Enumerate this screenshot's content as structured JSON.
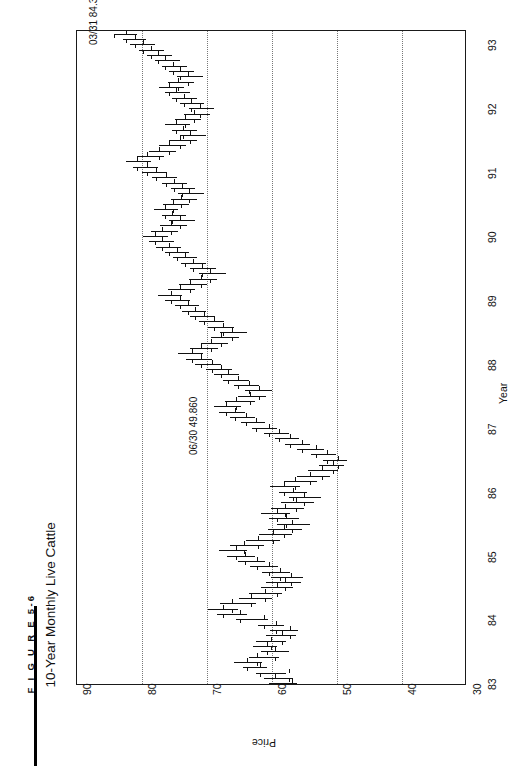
{
  "figure": {
    "number": "F I G U R E   5-6",
    "title": "10-Year Monthly Live Cattle"
  },
  "chart_data": {
    "type": "ohlc",
    "title": "10-Year Monthly Live Cattle",
    "xlabel": "Year",
    "ylabel": "Price",
    "orientation": "rotated-90-ccw",
    "xlim": [
      1983.0,
      1993.5
    ],
    "ylim": [
      30,
      90
    ],
    "xticks": [
      "83",
      "84",
      "85",
      "86",
      "87",
      "88",
      "89",
      "90",
      "91",
      "92",
      "93"
    ],
    "yticks": [
      "90",
      "80",
      "70",
      "60",
      "50",
      "40",
      "30"
    ],
    "ygrid_values": [
      80,
      70,
      60,
      50,
      40
    ],
    "grid": true,
    "legend": "none",
    "annotations": [
      {
        "label": "03/31 84.300",
        "date": "03/31",
        "value": 84.3
      },
      {
        "label": "06/30 49.860",
        "date": "06/30",
        "value": 49.86
      }
    ],
    "series_name": "Live Cattle monthly OHLC",
    "bars": [
      {
        "t": "1983-01",
        "high": 60.5,
        "low": 56.1,
        "open": 57.0,
        "close": 59.6
      },
      {
        "t": "1983-02",
        "high": 61.2,
        "low": 56.8,
        "open": 59.6,
        "close": 57.4
      },
      {
        "t": "1983-03",
        "high": 62.4,
        "low": 57.9,
        "open": 57.4,
        "close": 61.9
      },
      {
        "t": "1983-04",
        "high": 64.5,
        "low": 60.7,
        "open": 61.9,
        "close": 63.8
      },
      {
        "t": "1983-05",
        "high": 65.8,
        "low": 61.6,
        "open": 63.8,
        "close": 62.3
      },
      {
        "t": "1983-06",
        "high": 63.6,
        "low": 58.9,
        "open": 62.3,
        "close": 59.5
      },
      {
        "t": "1983-07",
        "high": 61.7,
        "low": 57.4,
        "open": 59.5,
        "close": 60.8
      },
      {
        "t": "1983-08",
        "high": 63.0,
        "low": 59.2,
        "open": 60.8,
        "close": 60.1
      },
      {
        "t": "1983-09",
        "high": 62.4,
        "low": 57.8,
        "open": 60.1,
        "close": 58.5
      },
      {
        "t": "1983-10",
        "high": 60.9,
        "low": 56.3,
        "open": 58.5,
        "close": 57.2
      },
      {
        "t": "1983-11",
        "high": 60.3,
        "low": 56.0,
        "open": 57.2,
        "close": 59.4
      },
      {
        "t": "1983-12",
        "high": 62.1,
        "low": 58.2,
        "open": 59.4,
        "close": 61.2
      },
      {
        "t": "1984-01",
        "high": 65.6,
        "low": 60.6,
        "open": 61.2,
        "close": 64.9
      },
      {
        "t": "1984-02",
        "high": 68.4,
        "low": 63.8,
        "open": 64.9,
        "close": 67.5
      },
      {
        "t": "1984-03",
        "high": 69.9,
        "low": 65.3,
        "open": 67.5,
        "close": 66.1
      },
      {
        "t": "1984-04",
        "high": 68.0,
        "low": 62.4,
        "open": 66.1,
        "close": 63.2
      },
      {
        "t": "1984-05",
        "high": 65.1,
        "low": 60.0,
        "open": 63.2,
        "close": 61.1
      },
      {
        "t": "1984-06",
        "high": 63.5,
        "low": 58.4,
        "open": 61.1,
        "close": 59.3
      },
      {
        "t": "1984-07",
        "high": 61.7,
        "low": 56.8,
        "open": 59.3,
        "close": 58.0
      },
      {
        "t": "1984-08",
        "high": 60.9,
        "low": 55.6,
        "open": 58.0,
        "close": 57.1
      },
      {
        "t": "1984-09",
        "high": 60.2,
        "low": 55.3,
        "open": 57.1,
        "close": 58.7
      },
      {
        "t": "1984-10",
        "high": 61.6,
        "low": 57.3,
        "open": 58.7,
        "close": 60.4
      },
      {
        "t": "1984-11",
        "high": 63.4,
        "low": 59.1,
        "open": 60.4,
        "close": 62.3
      },
      {
        "t": "1984-12",
        "high": 65.2,
        "low": 61.0,
        "open": 62.3,
        "close": 64.1
      },
      {
        "t": "1985-01",
        "high": 67.0,
        "low": 62.6,
        "open": 64.1,
        "close": 65.6
      },
      {
        "t": "1985-02",
        "high": 68.2,
        "low": 63.9,
        "open": 65.6,
        "close": 64.3
      },
      {
        "t": "1985-03",
        "high": 66.4,
        "low": 61.2,
        "open": 64.3,
        "close": 62.1
      },
      {
        "t": "1985-04",
        "high": 64.0,
        "low": 58.8,
        "open": 62.1,
        "close": 59.8
      },
      {
        "t": "1985-05",
        "high": 62.0,
        "low": 57.0,
        "open": 59.8,
        "close": 58.2
      },
      {
        "t": "1985-06",
        "high": 60.6,
        "low": 55.4,
        "open": 58.2,
        "close": 56.9
      },
      {
        "t": "1985-07",
        "high": 59.3,
        "low": 54.1,
        "open": 56.9,
        "close": 57.9
      },
      {
        "t": "1985-08",
        "high": 60.5,
        "low": 55.9,
        "open": 57.9,
        "close": 59.2
      },
      {
        "t": "1985-09",
        "high": 61.7,
        "low": 57.2,
        "open": 59.2,
        "close": 58.0
      },
      {
        "t": "1985-10",
        "high": 60.1,
        "low": 55.0,
        "open": 58.0,
        "close": 56.3
      },
      {
        "t": "1985-11",
        "high": 58.6,
        "low": 53.5,
        "open": 56.3,
        "close": 55.1
      },
      {
        "t": "1985-12",
        "high": 57.4,
        "low": 52.4,
        "open": 55.1,
        "close": 56.7
      },
      {
        "t": "1986-01",
        "high": 59.0,
        "low": 54.6,
        "open": 56.7,
        "close": 58.1
      },
      {
        "t": "1986-02",
        "high": 60.3,
        "low": 55.7,
        "open": 58.1,
        "close": 56.4
      },
      {
        "t": "1986-03",
        "high": 58.2,
        "low": 53.0,
        "open": 56.4,
        "close": 54.2
      },
      {
        "t": "1986-04",
        "high": 56.1,
        "low": 51.0,
        "open": 54.2,
        "close": 52.3
      },
      {
        "t": "1986-05",
        "high": 54.5,
        "low": 49.9,
        "open": 52.3,
        "close": 50.6
      },
      {
        "t": "1986-06",
        "high": 52.8,
        "low": 48.9,
        "open": 50.6,
        "close": 49.86
      },
      {
        "t": "1986-07",
        "high": 52.2,
        "low": 48.5,
        "open": 49.86,
        "close": 51.5
      },
      {
        "t": "1986-08",
        "high": 54.0,
        "low": 50.2,
        "open": 51.5,
        "close": 53.3
      },
      {
        "t": "1986-09",
        "high": 56.1,
        "low": 52.0,
        "open": 53.3,
        "close": 55.4
      },
      {
        "t": "1986-10",
        "high": 58.0,
        "low": 54.2,
        "open": 55.4,
        "close": 57.2
      },
      {
        "t": "1986-11",
        "high": 59.6,
        "low": 55.8,
        "open": 57.2,
        "close": 58.9
      },
      {
        "t": "1986-12",
        "high": 61.3,
        "low": 57.4,
        "open": 58.9,
        "close": 60.5
      },
      {
        "t": "1987-01",
        "high": 63.1,
        "low": 59.2,
        "open": 60.5,
        "close": 62.4
      },
      {
        "t": "1987-02",
        "high": 64.8,
        "low": 61.0,
        "open": 62.4,
        "close": 64.0
      },
      {
        "t": "1987-03",
        "high": 66.5,
        "low": 62.6,
        "open": 64.0,
        "close": 65.7
      },
      {
        "t": "1987-04",
        "high": 68.2,
        "low": 64.1,
        "open": 65.7,
        "close": 67.1
      },
      {
        "t": "1987-05",
        "high": 69.0,
        "low": 64.8,
        "open": 67.1,
        "close": 65.5
      },
      {
        "t": "1987-06",
        "high": 67.3,
        "low": 62.6,
        "open": 65.5,
        "close": 63.4
      },
      {
        "t": "1987-07",
        "high": 65.2,
        "low": 60.9,
        "open": 63.4,
        "close": 62.0
      },
      {
        "t": "1987-08",
        "high": 64.1,
        "low": 60.0,
        "open": 62.0,
        "close": 63.6
      },
      {
        "t": "1987-09",
        "high": 65.9,
        "low": 62.0,
        "open": 63.6,
        "close": 65.2
      },
      {
        "t": "1987-10",
        "high": 67.6,
        "low": 63.5,
        "open": 65.2,
        "close": 66.8
      },
      {
        "t": "1987-11",
        "high": 68.9,
        "low": 65.0,
        "open": 66.8,
        "close": 67.9
      },
      {
        "t": "1987-12",
        "high": 70.1,
        "low": 66.2,
        "open": 67.9,
        "close": 69.2
      },
      {
        "t": "1988-01",
        "high": 71.8,
        "low": 67.8,
        "open": 69.2,
        "close": 70.9
      },
      {
        "t": "1988-02",
        "high": 73.2,
        "low": 69.3,
        "open": 70.9,
        "close": 72.3
      },
      {
        "t": "1988-03",
        "high": 74.5,
        "low": 70.6,
        "open": 72.3,
        "close": 71.0
      },
      {
        "t": "1988-04",
        "high": 72.6,
        "low": 68.3,
        "open": 71.0,
        "close": 69.4
      },
      {
        "t": "1988-05",
        "high": 71.0,
        "low": 66.7,
        "open": 69.4,
        "close": 67.8
      },
      {
        "t": "1988-06",
        "high": 69.4,
        "low": 65.0,
        "open": 67.8,
        "close": 66.2
      },
      {
        "t": "1988-07",
        "high": 68.0,
        "low": 63.8,
        "open": 66.2,
        "close": 67.5
      },
      {
        "t": "1988-08",
        "high": 69.8,
        "low": 65.8,
        "open": 67.5,
        "close": 69.0
      },
      {
        "t": "1988-09",
        "high": 71.2,
        "low": 67.4,
        "open": 69.0,
        "close": 70.4
      },
      {
        "t": "1988-10",
        "high": 72.6,
        "low": 68.8,
        "open": 70.4,
        "close": 71.8
      },
      {
        "t": "1988-11",
        "high": 73.9,
        "low": 70.2,
        "open": 71.8,
        "close": 72.9
      },
      {
        "t": "1988-12",
        "high": 75.0,
        "low": 71.2,
        "open": 72.9,
        "close": 74.1
      },
      {
        "t": "1989-01",
        "high": 76.4,
        "low": 72.6,
        "open": 74.1,
        "close": 75.5
      },
      {
        "t": "1989-02",
        "high": 77.6,
        "low": 73.8,
        "open": 75.5,
        "close": 74.2
      },
      {
        "t": "1989-03",
        "high": 76.0,
        "low": 71.8,
        "open": 74.2,
        "close": 72.6
      },
      {
        "t": "1989-04",
        "high": 74.3,
        "low": 70.0,
        "open": 72.6,
        "close": 71.0
      },
      {
        "t": "1989-05",
        "high": 72.8,
        "low": 68.4,
        "open": 71.0,
        "close": 69.6
      },
      {
        "t": "1989-06",
        "high": 71.2,
        "low": 67.0,
        "open": 69.6,
        "close": 70.8
      },
      {
        "t": "1989-07",
        "high": 72.6,
        "low": 68.6,
        "open": 70.8,
        "close": 72.1
      },
      {
        "t": "1989-08",
        "high": 74.0,
        "low": 70.2,
        "open": 72.1,
        "close": 73.4
      },
      {
        "t": "1989-09",
        "high": 75.3,
        "low": 71.6,
        "open": 73.4,
        "close": 74.6
      },
      {
        "t": "1989-10",
        "high": 76.5,
        "low": 72.8,
        "open": 74.6,
        "close": 75.8
      },
      {
        "t": "1989-11",
        "high": 77.8,
        "low": 74.0,
        "open": 75.8,
        "close": 76.9
      },
      {
        "t": "1989-12",
        "high": 78.9,
        "low": 75.1,
        "open": 76.9,
        "close": 78.0
      },
      {
        "t": "1990-01",
        "high": 79.8,
        "low": 76.0,
        "open": 78.0,
        "close": 77.0
      },
      {
        "t": "1990-02",
        "high": 78.6,
        "low": 74.4,
        "open": 77.0,
        "close": 75.6
      },
      {
        "t": "1990-03",
        "high": 77.2,
        "low": 73.0,
        "open": 75.6,
        "close": 74.2
      },
      {
        "t": "1990-04",
        "high": 75.9,
        "low": 71.8,
        "open": 74.2,
        "close": 75.4
      },
      {
        "t": "1990-05",
        "high": 77.0,
        "low": 73.2,
        "open": 75.4,
        "close": 76.5
      },
      {
        "t": "1990-06",
        "high": 78.2,
        "low": 74.4,
        "open": 76.5,
        "close": 75.2
      },
      {
        "t": "1990-07",
        "high": 76.8,
        "low": 72.8,
        "open": 75.2,
        "close": 74.0
      },
      {
        "t": "1990-08",
        "high": 75.6,
        "low": 71.6,
        "open": 74.0,
        "close": 72.8
      },
      {
        "t": "1990-09",
        "high": 74.4,
        "low": 70.4,
        "open": 72.8,
        "close": 73.9
      },
      {
        "t": "1990-10",
        "high": 75.6,
        "low": 71.8,
        "open": 73.9,
        "close": 75.1
      },
      {
        "t": "1990-11",
        "high": 76.9,
        "low": 73.0,
        "open": 75.1,
        "close": 76.3
      },
      {
        "t": "1990-12",
        "high": 78.4,
        "low": 74.6,
        "open": 76.3,
        "close": 77.8
      },
      {
        "t": "1991-01",
        "high": 80.0,
        "low": 76.1,
        "open": 77.8,
        "close": 79.3
      },
      {
        "t": "1991-02",
        "high": 81.4,
        "low": 77.6,
        "open": 79.3,
        "close": 80.7
      },
      {
        "t": "1991-03",
        "high": 82.4,
        "low": 78.6,
        "open": 80.7,
        "close": 79.2
      },
      {
        "t": "1991-04",
        "high": 80.8,
        "low": 76.6,
        "open": 79.2,
        "close": 77.4
      },
      {
        "t": "1991-05",
        "high": 79.0,
        "low": 74.8,
        "open": 77.4,
        "close": 75.8
      },
      {
        "t": "1991-06",
        "high": 77.4,
        "low": 73.2,
        "open": 75.8,
        "close": 74.1
      },
      {
        "t": "1991-07",
        "high": 75.8,
        "low": 71.6,
        "open": 74.1,
        "close": 72.6
      },
      {
        "t": "1991-08",
        "high": 74.2,
        "low": 70.2,
        "open": 72.6,
        "close": 73.7
      },
      {
        "t": "1991-09",
        "high": 75.4,
        "low": 71.6,
        "open": 73.7,
        "close": 74.8
      },
      {
        "t": "1991-10",
        "high": 76.4,
        "low": 72.6,
        "open": 74.8,
        "close": 73.4
      },
      {
        "t": "1991-11",
        "high": 75.0,
        "low": 71.0,
        "open": 73.4,
        "close": 72.0
      },
      {
        "t": "1991-12",
        "high": 73.6,
        "low": 69.6,
        "open": 72.0,
        "close": 71.1
      },
      {
        "t": "1992-01",
        "high": 72.8,
        "low": 68.9,
        "open": 71.1,
        "close": 72.4
      },
      {
        "t": "1992-02",
        "high": 74.2,
        "low": 70.4,
        "open": 72.4,
        "close": 73.6
      },
      {
        "t": "1992-03",
        "high": 75.4,
        "low": 71.6,
        "open": 73.6,
        "close": 74.7
      },
      {
        "t": "1992-04",
        "high": 76.4,
        "low": 72.6,
        "open": 74.7,
        "close": 75.8
      },
      {
        "t": "1992-05",
        "high": 77.4,
        "low": 73.6,
        "open": 75.8,
        "close": 74.4
      },
      {
        "t": "1992-06",
        "high": 76.0,
        "low": 72.0,
        "open": 74.4,
        "close": 73.0
      },
      {
        "t": "1992-07",
        "high": 74.6,
        "low": 70.6,
        "open": 73.0,
        "close": 74.2
      },
      {
        "t": "1992-08",
        "high": 75.8,
        "low": 72.0,
        "open": 74.2,
        "close": 75.3
      },
      {
        "t": "1992-09",
        "high": 76.9,
        "low": 73.1,
        "open": 75.3,
        "close": 76.4
      },
      {
        "t": "1992-10",
        "high": 78.0,
        "low": 74.2,
        "open": 76.4,
        "close": 77.5
      },
      {
        "t": "1992-11",
        "high": 79.2,
        "low": 75.4,
        "open": 77.5,
        "close": 78.6
      },
      {
        "t": "1992-12",
        "high": 80.4,
        "low": 76.6,
        "open": 78.6,
        "close": 79.8
      },
      {
        "t": "1993-01",
        "high": 81.8,
        "low": 78.0,
        "open": 79.8,
        "close": 81.1
      },
      {
        "t": "1993-02",
        "high": 83.0,
        "low": 79.4,
        "open": 81.1,
        "close": 82.4
      },
      {
        "t": "1993-03",
        "high": 84.3,
        "low": 80.8,
        "open": 82.4,
        "close": 84.3
      }
    ]
  }
}
